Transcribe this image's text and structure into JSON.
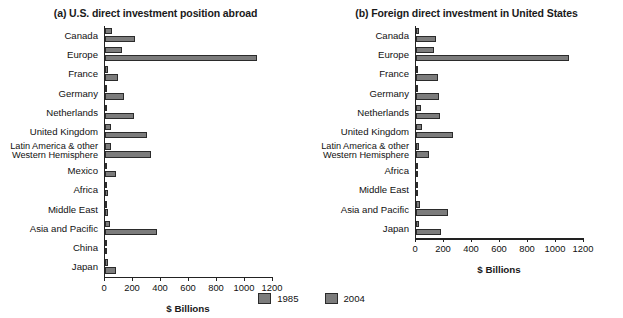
{
  "chart_data": [
    {
      "type": "bar",
      "title": "(a) U.S. direct investment position abroad",
      "xlabel": "$ Billions",
      "ylabel": "",
      "xlim": [
        0,
        1200
      ],
      "xticks": [
        0,
        200,
        400,
        600,
        800,
        1000,
        1200
      ],
      "xticklabels": [
        "0",
        "200",
        "400",
        "600",
        "800",
        "1000",
        "1200"
      ],
      "grid": false,
      "orientation": "horizontal",
      "categories": [
        "Canada",
        "Europe",
        "France",
        "Germany",
        "Netherlands",
        "United Kingdom",
        "Latin America & other\nWestern Hemisphere",
        "Mexico",
        "Africa",
        "Middle East",
        "Asia and Pacific",
        "China",
        "Japan"
      ],
      "series": [
        {
          "name": "1985",
          "color": "#7c7c7c",
          "values": [
            47,
            120,
            23,
            17,
            13,
            45,
            40,
            5,
            6,
            5,
            35,
            1,
            19
          ]
        },
        {
          "name": "2004",
          "color": "#7c7c7c",
          "values": [
            217,
            1085,
            90,
            135,
            210,
            300,
            330,
            78,
            22,
            20,
            370,
            16,
            80
          ]
        }
      ]
    },
    {
      "type": "bar",
      "title": "(b) Foreign direct investment in United States",
      "xlabel": "$ Billions",
      "ylabel": "",
      "xlim": [
        0,
        1200
      ],
      "xticks": [
        0,
        200,
        400,
        600,
        800,
        1000,
        1200
      ],
      "xticklabels": [
        "0",
        "200",
        "400",
        "600",
        "800",
        "1000",
        "1200"
      ],
      "grid": false,
      "orientation": "horizontal",
      "categories": [
        "Canada",
        "Europe",
        "France",
        "Germany",
        "Netherlands",
        "United Kingdom",
        "Latin America & other\nWestern Hemisphere",
        "Africa",
        "Middle East",
        "Asia and Pacific",
        "Japan"
      ],
      "series": [
        {
          "name": "1985",
          "color": "#7c7c7c",
          "values": [
            20,
            125,
            7,
            12,
            38,
            45,
            20,
            1,
            5,
            25,
            20
          ]
        },
        {
          "name": "2004",
          "color": "#7c7c7c",
          "values": [
            145,
            1090,
            160,
            165,
            170,
            265,
            95,
            3,
            8,
            230,
            175
          ]
        }
      ]
    }
  ],
  "legend": {
    "position": "bottom-center",
    "entries": [
      {
        "label": "1985",
        "color": "#7c7c7c"
      },
      {
        "label": "2004",
        "color": "#7c7c7c"
      }
    ]
  }
}
